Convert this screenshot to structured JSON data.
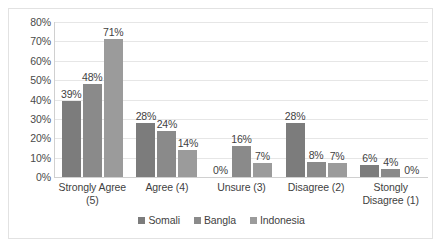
{
  "chart_data": {
    "type": "bar",
    "title": "",
    "subtitle": "",
    "xlabel": "",
    "ylabel": "",
    "ylim": [
      0,
      80
    ],
    "ytick_labels": [
      "80%",
      "70%",
      "60%",
      "50%",
      "40%",
      "30%",
      "20%",
      "10%",
      "0%"
    ],
    "ytick_values": [
      80,
      70,
      60,
      50,
      40,
      30,
      20,
      10,
      0
    ],
    "grid": true,
    "legend_position": "bottom",
    "categories": [
      "Strongly Agree (5)",
      "Agree (4)",
      "Unsure (3)",
      "Disagree (2)",
      "Stongly Disagree (1)"
    ],
    "category_lines": [
      [
        "Strongly Agree",
        "(5)"
      ],
      [
        "Agree (4)"
      ],
      [
        "Unsure (3)"
      ],
      [
        "Disagree (2)"
      ],
      [
        "Stongly",
        "Disagree (1)"
      ]
    ],
    "series": [
      {
        "name": "Somali",
        "color": "#7c7c7c",
        "values": [
          39,
          28,
          0,
          28,
          6
        ],
        "labels": [
          "39%",
          "28%",
          "0%",
          "28%",
          "6%"
        ]
      },
      {
        "name": "Bangla",
        "color": "#8a8a8a",
        "values": [
          48,
          24,
          16,
          8,
          4
        ],
        "labels": [
          "48%",
          "24%",
          "16%",
          "8%",
          "4%"
        ]
      },
      {
        "name": "Indonesia",
        "color": "#9b9b9b",
        "values": [
          71,
          14,
          7,
          7,
          0
        ],
        "labels": [
          "71%",
          "14%",
          "7%",
          "7%",
          "0%"
        ]
      }
    ]
  },
  "legend": {
    "items": [
      {
        "label": "Somali",
        "color": "#7c7c7c"
      },
      {
        "label": "Bangla",
        "color": "#8a8a8a"
      },
      {
        "label": "Indonesia",
        "color": "#9b9b9b"
      }
    ]
  }
}
